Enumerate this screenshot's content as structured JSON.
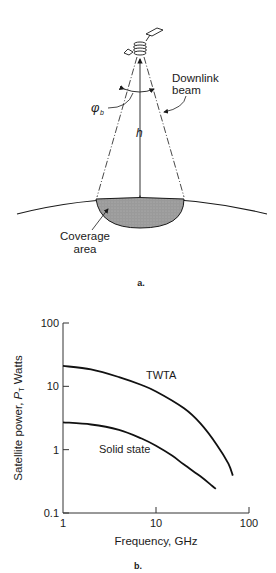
{
  "figure_a": {
    "downlink_label_line1": "Downlink",
    "downlink_label_line2": "beam",
    "angle_label": "φ",
    "angle_subscript": "b",
    "height_label": "h",
    "coverage_label_line1": "Coverage",
    "coverage_label_line2": "area",
    "caption": "a."
  },
  "figure_b": {
    "caption": "b."
  },
  "chart_data": {
    "type": "line",
    "title": "",
    "xlabel": "Frequency, GHz",
    "ylabel_prefix": "Satellite power, ",
    "ylabel_symbol": "P",
    "ylabel_subscript": "T",
    "ylabel_suffix": " Watts",
    "xscale": "log",
    "yscale": "log",
    "xlim": [
      1,
      100
    ],
    "ylim": [
      0.1,
      100
    ],
    "xticks": [
      1,
      10,
      100
    ],
    "xtick_labels": [
      "1",
      "10",
      "100"
    ],
    "yticks": [
      0.1,
      1,
      10,
      100
    ],
    "ytick_labels": [
      "0.1",
      "1",
      "10",
      "100"
    ],
    "grid": false,
    "series": [
      {
        "name": "TWTA",
        "x": [
          1,
          2,
          4,
          7,
          10,
          20,
          30,
          45,
          60,
          67
        ],
        "y": [
          21,
          18.5,
          14,
          10.5,
          8.3,
          4.5,
          2.6,
          1.2,
          0.6,
          0.39
        ]
      },
      {
        "name": "Solid state",
        "x": [
          1,
          2,
          4,
          7,
          10,
          15,
          20,
          30,
          40,
          44
        ],
        "y": [
          2.7,
          2.5,
          2.05,
          1.5,
          1.15,
          0.8,
          0.58,
          0.38,
          0.27,
          0.24
        ]
      }
    ]
  }
}
